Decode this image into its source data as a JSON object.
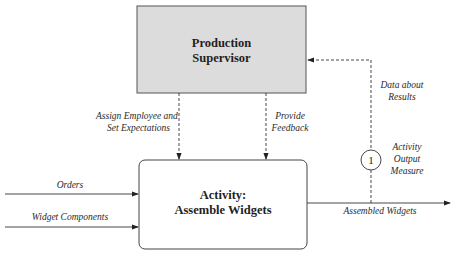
{
  "supervisor": {
    "title_line1": "Production",
    "title_line2": "Supervisor"
  },
  "activity": {
    "title_line1": "Activity:",
    "title_line2": "Assemble Widgets"
  },
  "inputs": [
    {
      "label": "Orders"
    },
    {
      "label": "Widget Components"
    }
  ],
  "controls": {
    "assign_line1": "Assign Employee and",
    "assign_line2": "Set Expectations",
    "feedback_line1": "Provide",
    "feedback_line2": "Feedback"
  },
  "output": {
    "label": "Assembled Widgets"
  },
  "feedback_loop": {
    "line1": "Data about",
    "line2": "Results"
  },
  "measure": {
    "number": "1",
    "line1": "Activity",
    "line2": "Output",
    "line3": "Measure"
  },
  "colors": {
    "supervisor_fill": "#dcdcdc",
    "stroke": "#333333"
  }
}
